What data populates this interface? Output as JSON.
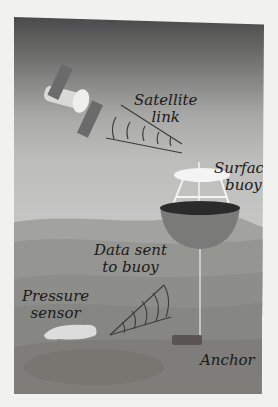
{
  "figure": {
    "labels": {
      "satellite_link": [
        "Satellite",
        "link"
      ],
      "surface_buoy": [
        "Surface",
        "buoy"
      ],
      "data_sent": [
        "Data sent",
        "to buoy"
      ],
      "pressure_sensor": [
        "Pressure",
        "sensor"
      ],
      "anchor": "Anchor"
    },
    "colors": {
      "sky_top": "#4a4a4a",
      "sky_bottom": "#c6c6c4",
      "ocean_surface": "#9c9c98",
      "ocean_mid": "#8a8a86",
      "seafloor": "#7b7a76",
      "buoy": "#6e6e6c",
      "anchor": "#5a5552"
    }
  }
}
